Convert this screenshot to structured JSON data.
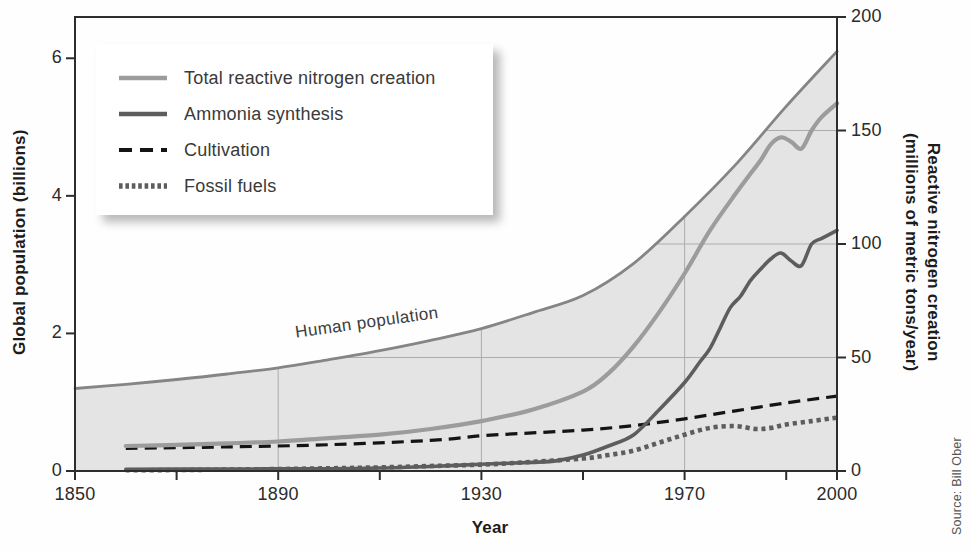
{
  "figure": {
    "human_population_label": "Human population",
    "source_credit": "Source: Bill Ober"
  },
  "colors": {
    "area_fill": "#e4e4e4",
    "population_line": "#858585",
    "grid": "#adadad",
    "axis": "#2d2d2d",
    "tick_text": "#2b2b2b",
    "legend_bg": "#ffffff"
  },
  "legend": {
    "items": [
      {
        "label": "Total reactive nitrogen creation",
        "color": "#9c9c9c",
        "width": 4.5,
        "dash": ""
      },
      {
        "label": "Ammonia synthesis",
        "color": "#5d5d5d",
        "width": 4.5,
        "dash": ""
      },
      {
        "label": "Cultivation",
        "color": "#141414",
        "width": 4,
        "dash": "13 8"
      },
      {
        "label": "Fossil fuels",
        "color": "#5d5d5d",
        "width": 5.5,
        "dash": "3.6 2.8"
      }
    ]
  },
  "chart_data": {
    "type": "line",
    "title": "",
    "axes": {
      "x": {
        "title": "Year",
        "min": 1850,
        "max": 2000,
        "major_ticks": [
          1850,
          1890,
          1930,
          1970,
          2000
        ],
        "minor_ticks": [
          1870,
          1910,
          1950,
          1990
        ]
      },
      "y_left": {
        "title": "Global population (billions)",
        "min": 0,
        "max": 6.6,
        "ticks": [
          0,
          2,
          4,
          6
        ]
      },
      "y_right": {
        "title_line1": "Reactive nitrogen creation",
        "title_line2": "(millions of metric tons/year)",
        "min": 0,
        "max": 200,
        "ticks": [
          0,
          50,
          100,
          150,
          200
        ]
      }
    },
    "grid": {
      "vertical_years": [
        1890,
        1930,
        1970
      ],
      "horizontal_values_right": [
        50,
        100,
        150
      ]
    },
    "series": [
      {
        "name": "Human population",
        "axis": "left",
        "style": "area",
        "color": "#858585",
        "stroke_width": 2.8,
        "dash": "",
        "points": [
          [
            1850,
            1.2
          ],
          [
            1860,
            1.26
          ],
          [
            1870,
            1.33
          ],
          [
            1880,
            1.41
          ],
          [
            1890,
            1.5
          ],
          [
            1900,
            1.62
          ],
          [
            1910,
            1.75
          ],
          [
            1920,
            1.9
          ],
          [
            1930,
            2.07
          ],
          [
            1940,
            2.3
          ],
          [
            1950,
            2.55
          ],
          [
            1960,
            3.02
          ],
          [
            1970,
            3.7
          ],
          [
            1980,
            4.45
          ],
          [
            1990,
            5.3
          ],
          [
            2000,
            6.1
          ]
        ]
      },
      {
        "name": "Cultivation",
        "axis": "right",
        "style": "line",
        "color": "#141414",
        "stroke_width": 3.2,
        "dash": "12 7",
        "points": [
          [
            1860,
            10
          ],
          [
            1880,
            10.6
          ],
          [
            1900,
            11.6
          ],
          [
            1920,
            13.5
          ],
          [
            1930,
            15.5
          ],
          [
            1940,
            16.8
          ],
          [
            1950,
            18
          ],
          [
            1960,
            20
          ],
          [
            1970,
            23
          ],
          [
            1980,
            26.5
          ],
          [
            1990,
            30
          ],
          [
            2000,
            33
          ]
        ]
      },
      {
        "name": "Fossil fuels",
        "axis": "right",
        "style": "line",
        "color": "#5d5d5d",
        "stroke_width": 4.6,
        "dash": "4.2 3.8",
        "points": [
          [
            1860,
            0.3
          ],
          [
            1880,
            0.6
          ],
          [
            1900,
            1.2
          ],
          [
            1910,
            1.6
          ],
          [
            1920,
            2.2
          ],
          [
            1930,
            2.8
          ],
          [
            1940,
            4
          ],
          [
            1950,
            5.5
          ],
          [
            1955,
            7
          ],
          [
            1960,
            9
          ],
          [
            1965,
            12.5
          ],
          [
            1970,
            16
          ],
          [
            1975,
            19
          ],
          [
            1980,
            19.8
          ],
          [
            1984,
            18.5
          ],
          [
            1987,
            19
          ],
          [
            1990,
            20.5
          ],
          [
            1995,
            22
          ],
          [
            2000,
            23.5
          ]
        ]
      },
      {
        "name": "Ammonia synthesis",
        "axis": "right",
        "style": "line",
        "color": "#5d5d5d",
        "stroke_width": 3.6,
        "dash": "",
        "points": [
          [
            1860,
            0.8
          ],
          [
            1880,
            0.9
          ],
          [
            1900,
            1
          ],
          [
            1910,
            1.3
          ],
          [
            1920,
            2
          ],
          [
            1930,
            3
          ],
          [
            1940,
            3.8
          ],
          [
            1945,
            4.6
          ],
          [
            1950,
            7
          ],
          [
            1955,
            11
          ],
          [
            1960,
            16
          ],
          [
            1965,
            27
          ],
          [
            1970,
            39
          ],
          [
            1973,
            48
          ],
          [
            1975,
            54
          ],
          [
            1977,
            63
          ],
          [
            1979,
            72
          ],
          [
            1981,
            77
          ],
          [
            1983,
            84
          ],
          [
            1985,
            89
          ],
          [
            1987,
            93.5
          ],
          [
            1989,
            96
          ],
          [
            1991,
            92.5
          ],
          [
            1993,
            90.5
          ],
          [
            1995,
            100
          ],
          [
            1997,
            102.5
          ],
          [
            2000,
            106
          ]
        ]
      },
      {
        "name": "Total reactive nitrogen creation",
        "axis": "right",
        "style": "line",
        "color": "#9c9c9c",
        "stroke_width": 4.2,
        "dash": "",
        "points": [
          [
            1860,
            11
          ],
          [
            1870,
            11.5
          ],
          [
            1880,
            12.2
          ],
          [
            1890,
            13
          ],
          [
            1900,
            14.5
          ],
          [
            1910,
            16
          ],
          [
            1920,
            18.5
          ],
          [
            1930,
            22
          ],
          [
            1940,
            27
          ],
          [
            1950,
            35
          ],
          [
            1955,
            43
          ],
          [
            1960,
            55
          ],
          [
            1965,
            70
          ],
          [
            1970,
            87
          ],
          [
            1975,
            106
          ],
          [
            1980,
            122
          ],
          [
            1983,
            131
          ],
          [
            1985,
            137
          ],
          [
            1987,
            144
          ],
          [
            1989,
            147
          ],
          [
            1991,
            145
          ],
          [
            1993,
            142
          ],
          [
            1995,
            150
          ],
          [
            1997,
            156
          ],
          [
            2000,
            162
          ]
        ]
      }
    ]
  }
}
